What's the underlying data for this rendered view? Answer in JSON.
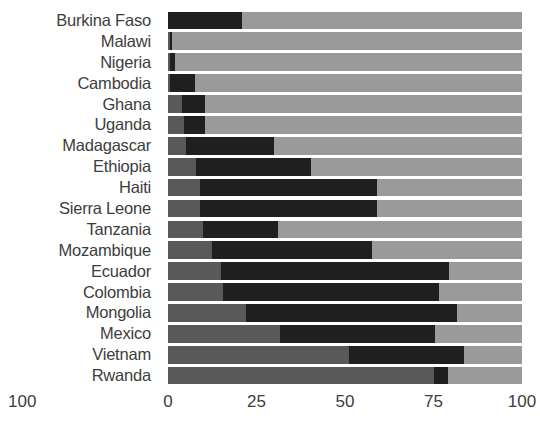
{
  "chart_data": {
    "type": "bar",
    "orientation": "horizontal",
    "subtype": "stacked-range",
    "title": "",
    "subtitle": "",
    "xlabel": "",
    "ylabel": "",
    "xlim": [
      0,
      100
    ],
    "xticks": [
      0,
      25,
      50,
      75,
      100
    ],
    "xticklabels": [
      "0",
      "25",
      "50",
      "75",
      "100"
    ],
    "grid": false,
    "legend": "none",
    "categories": [
      "Burkina Faso",
      "Malawi",
      "Nigeria",
      "Cambodia",
      "Ghana",
      "Uganda",
      "Madagascar",
      "Ethiopia",
      "Haiti",
      "Sierra Leone",
      "Tanzania",
      "Mozambique",
      "Ecuador",
      "Colombia",
      "Mongolia",
      "Mexico",
      "Vietnam",
      "Rwanda"
    ],
    "series": [
      {
        "name": "lower-segment",
        "color": "#595959",
        "values": [
          0,
          0.5,
          0.5,
          0.6,
          4,
          4.5,
          5,
          8,
          9,
          9,
          10,
          12.5,
          15,
          15.5,
          22,
          31.5,
          51,
          75
        ]
      },
      {
        "name": "middle-segment",
        "color": "#1f1f1f",
        "values": [
          21,
          1,
          2,
          7.5,
          10.5,
          10.5,
          30,
          40.5,
          59,
          59,
          31,
          57.5,
          79.5,
          76.5,
          81.5,
          75.5,
          83.5,
          79
        ]
      },
      {
        "name": "upper-segment",
        "color": "#9a9a9a",
        "values": [
          100,
          100,
          100,
          100,
          100,
          100,
          100,
          100,
          100,
          100,
          100,
          100,
          100,
          100,
          100,
          100,
          100,
          100
        ]
      }
    ],
    "bars": [
      {
        "label": "Burkina Faso",
        "low": 0,
        "mid": 21,
        "high": 100
      },
      {
        "label": "Malawi",
        "low": 0.5,
        "mid": 1,
        "high": 100
      },
      {
        "label": "Nigeria",
        "low": 0.5,
        "mid": 2,
        "high": 100
      },
      {
        "label": "Cambodia",
        "low": 0.6,
        "mid": 7.5,
        "high": 100
      },
      {
        "label": "Ghana",
        "low": 4,
        "mid": 10.5,
        "high": 100
      },
      {
        "label": "Uganda",
        "low": 4.5,
        "mid": 10.5,
        "high": 100
      },
      {
        "label": "Madagascar",
        "low": 5,
        "mid": 30,
        "high": 100
      },
      {
        "label": "Ethiopia",
        "low": 8,
        "mid": 40.5,
        "high": 100
      },
      {
        "label": "Haiti",
        "low": 9,
        "mid": 59,
        "high": 100
      },
      {
        "label": "Sierra Leone",
        "low": 9,
        "mid": 59,
        "high": 100
      },
      {
        "label": "Tanzania",
        "low": 10,
        "mid": 31,
        "high": 100
      },
      {
        "label": "Mozambique",
        "low": 12.5,
        "mid": 57.5,
        "high": 100
      },
      {
        "label": "Ecuador",
        "low": 15,
        "mid": 79.5,
        "high": 100
      },
      {
        "label": "Colombia",
        "low": 15.5,
        "mid": 76.5,
        "high": 100
      },
      {
        "label": "Mongolia",
        "low": 22,
        "mid": 81.5,
        "high": 100
      },
      {
        "label": "Mexico",
        "low": 31.5,
        "mid": 75.5,
        "high": 100
      },
      {
        "label": "Vietnam",
        "low": 51,
        "mid": 83.5,
        "high": 100
      },
      {
        "label": "Rwanda",
        "low": 75,
        "mid": 79,
        "high": 100
      }
    ],
    "colors": {
      "low_segment": "#595959",
      "mid_segment": "#1f1f1f",
      "high_segment": "#9a9a9a",
      "background": "#ffffff",
      "text": "#3d3d3d"
    },
    "annotations": [
      {
        "name": "left-edge-axis-label",
        "text": "100"
      }
    ]
  }
}
